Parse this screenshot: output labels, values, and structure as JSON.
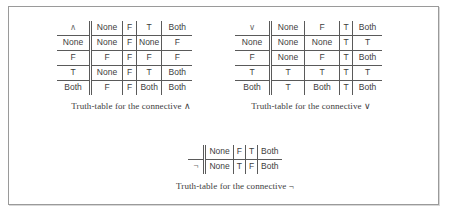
{
  "figure": {
    "kind": "truth-tables-figure",
    "background_color": "#ffffff",
    "border_color": "#9a9a9a",
    "text_color": "#3d3d3d",
    "rule_color": "#5a5a5a"
  },
  "tables": {
    "conjunction": {
      "connective": "∧",
      "caption": "Truth-table for the connective ∧",
      "column_headers": [
        "None",
        "F",
        "T",
        "Both"
      ],
      "row_headers": [
        "None",
        "F",
        "T",
        "Both"
      ],
      "rows": [
        [
          "None",
          "F",
          "None",
          "F"
        ],
        [
          "F",
          "F",
          "F",
          "F"
        ],
        [
          "None",
          "F",
          "T",
          "Both"
        ],
        [
          "F",
          "F",
          "Both",
          "Both"
        ]
      ]
    },
    "disjunction": {
      "connective": "∨",
      "caption": "Truth-table for the connective ∨",
      "column_headers": [
        "None",
        "F",
        "T",
        "Both"
      ],
      "row_headers": [
        "None",
        "F",
        "T",
        "Both"
      ],
      "rows": [
        [
          "None",
          "None",
          "T",
          "T"
        ],
        [
          "None",
          "F",
          "T",
          "Both"
        ],
        [
          "T",
          "T",
          "T",
          "T"
        ],
        [
          "T",
          "Both",
          "T",
          "Both"
        ]
      ]
    },
    "negation": {
      "connective": "¬",
      "caption": "Truth-table for the connective ¬",
      "corner_label": "",
      "column_headers": [
        "None",
        "F",
        "T",
        "Both"
      ],
      "row_header": "¬",
      "values": [
        "None",
        "T",
        "F",
        "Both"
      ]
    }
  }
}
